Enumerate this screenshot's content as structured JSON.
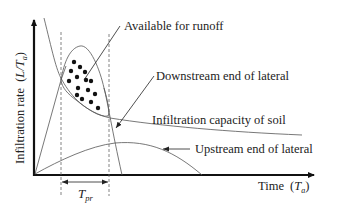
{
  "diagram": {
    "y_axis_label": "Infiltration rate",
    "y_axis_unit_open": "(",
    "y_axis_unit_L": "L",
    "y_axis_unit_slash": "/",
    "y_axis_unit_T": "T",
    "y_axis_unit_sub": "a",
    "y_axis_unit_close": ")",
    "x_axis_label": "Time",
    "x_axis_unit_open": "(",
    "x_axis_unit_T": "T",
    "x_axis_unit_sub": "a",
    "x_axis_unit_close": ")",
    "interval_label_T": "T",
    "interval_label_sub": "pr",
    "annotations": [
      {
        "text": "Available for runoff"
      },
      {
        "text": "Downstream end of lateral"
      },
      {
        "text": "Infiltration capacity of soil"
      },
      {
        "text": "Upstream end of lateral"
      }
    ],
    "colors": {
      "axis": "#111111",
      "curve": "#555555",
      "dots": "#111111",
      "background": "#ffffff"
    }
  }
}
